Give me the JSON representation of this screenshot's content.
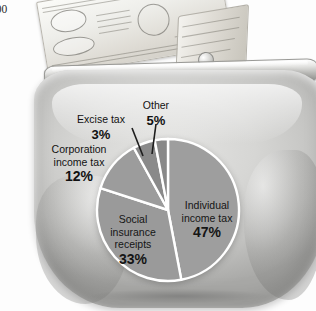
{
  "caption": {
    "line1": "000",
    "line2": "rs",
    "line3": "e"
  },
  "photo": {
    "purse_label": "coin-purse",
    "banknote_label": "dollar-banknote",
    "clasp_label": "purse-clasp"
  },
  "chart_data": {
    "type": "pie",
    "title": "",
    "categories": [
      "Individual income tax",
      "Social insurance receipts",
      "Corporation income tax",
      "Other",
      "Excise tax"
    ],
    "values": [
      47,
      33,
      12,
      5,
      3
    ],
    "value_labels": [
      "47%",
      "33%",
      "12%",
      "5%",
      "3%"
    ],
    "unit": "%",
    "total": 100,
    "start_angle": 0,
    "direction": "clockwise",
    "legend": "none",
    "grid": false,
    "colors": [
      "#9e9e9e",
      "#9a9a9a",
      "#9c9c9c",
      "#8a8a8a",
      "#888888"
    ],
    "separator_color": "#ffffff",
    "slices": [
      {
        "name": "Individual income tax",
        "label_line1": "Individual",
        "label_line2": "income tax",
        "pct": "47%",
        "value": 47,
        "placement": "inside"
      },
      {
        "name": "Social insurance receipts",
        "label_line1": "Social",
        "label_line2": "insurance",
        "label_line3": "receipts",
        "pct": "33%",
        "value": 33,
        "placement": "inside"
      },
      {
        "name": "Corporation income tax",
        "label_line1": "Corporation",
        "label_line2": "income tax",
        "pct": "12%",
        "value": 12,
        "placement": "outside"
      },
      {
        "name": "Other",
        "label_line1": "Other",
        "pct": "5%",
        "value": 5,
        "placement": "outside-leader"
      },
      {
        "name": "Excise tax",
        "label_line1": "Excise tax",
        "pct": "3%",
        "value": 3,
        "placement": "outside-leader"
      }
    ]
  }
}
